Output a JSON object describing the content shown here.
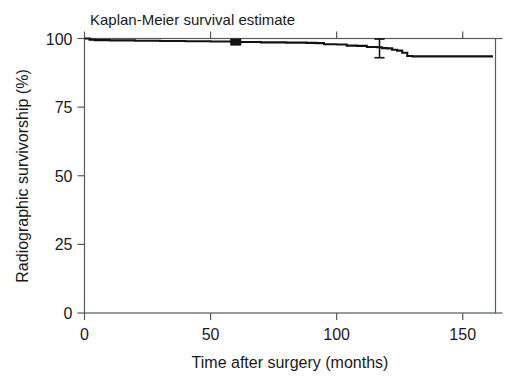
{
  "figure": {
    "width": 517,
    "height": 391,
    "background": "#ffffff",
    "foreground": "#121212",
    "axis_color": "#555a5c",
    "footer_partial_text": ""
  },
  "chart_data": {
    "type": "line",
    "title": "Kaplan-Meier survival estimate",
    "xlabel": "Time after surgery (months)",
    "ylabel": "Radiographic survivorship (%)",
    "xlim": [
      0,
      163
    ],
    "ylim": [
      0,
      100
    ],
    "xticks": [
      0,
      50,
      100,
      150
    ],
    "xtick_labels": [
      "0",
      "50",
      "100",
      "150"
    ],
    "yticks": [
      0,
      25,
      50,
      75,
      100
    ],
    "ytick_labels": [
      "0",
      "25",
      "50",
      "75",
      "100"
    ],
    "grid": false,
    "legend": null,
    "step_style": "post",
    "series": [
      {
        "name": "Radiographic survivorship",
        "color": "#121212",
        "x": [
          0,
          2,
          4,
          10,
          20,
          30,
          40,
          50,
          58,
          60,
          62,
          70,
          80,
          88,
          92,
          95,
          100,
          104,
          108,
          112,
          116,
          118,
          120,
          122,
          124,
          126,
          128,
          130,
          134,
          140,
          146,
          152,
          158,
          162
        ],
        "y": [
          100.0,
          99.6,
          99.4,
          99.3,
          99.2,
          99.1,
          99.0,
          98.9,
          98.8,
          98.7,
          98.7,
          98.6,
          98.5,
          98.4,
          98.3,
          97.9,
          97.8,
          97.4,
          97.3,
          96.9,
          96.8,
          96.5,
          96.4,
          95.9,
          95.6,
          94.8,
          93.6,
          93.5,
          93.5,
          93.5,
          93.5,
          93.5,
          93.5,
          93.5
        ]
      }
    ],
    "confidence_intervals": [
      {
        "x": 117,
        "y": 96.6,
        "lower": 93.0,
        "upper": 99.8
      }
    ],
    "censor_markers": [
      {
        "x": 60,
        "y": 98.7
      }
    ],
    "annotations": []
  }
}
